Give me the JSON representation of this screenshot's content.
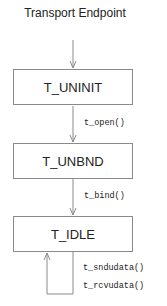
{
  "diagram": {
    "title": "Transport Endpoint",
    "states": [
      {
        "label": "T_UNINIT"
      },
      {
        "label": "T_UNBND"
      },
      {
        "label": "T_IDLE"
      }
    ],
    "transitions": [
      {
        "from": "start",
        "to": "T_UNINIT",
        "label": ""
      },
      {
        "from": "T_UNINIT",
        "to": "T_UNBND",
        "label": "t_open()"
      },
      {
        "from": "T_UNBND",
        "to": "T_IDLE",
        "label": "t_bind()"
      },
      {
        "from": "T_IDLE",
        "to": "T_IDLE",
        "labels": [
          "t_sndudata()",
          "t_rcvudata()"
        ]
      }
    ],
    "colors": {
      "line": "#8a8a8a",
      "text": "#222222"
    }
  }
}
